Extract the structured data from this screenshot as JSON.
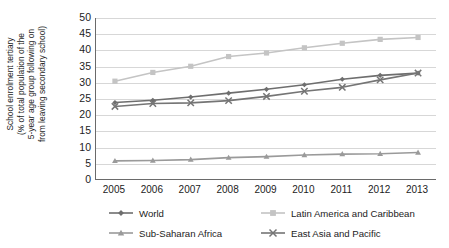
{
  "chart_data": {
    "type": "line",
    "title": "",
    "xlabel": "",
    "ylabel": "School enrolment tertiary (% of total population of the 5-year age group following on from leaving secondary school)",
    "ylabel_lines": [
      "School enrolment tertiary",
      "(% of total population of the",
      "5-year age group following on",
      "from leaving secondary school)"
    ],
    "categories": [
      "2005",
      "2006",
      "2007",
      "2008",
      "2009",
      "2010",
      "2011",
      "2012",
      "2013"
    ],
    "x": [
      2005,
      2006,
      2007,
      2008,
      2009,
      2010,
      2011,
      2012,
      2013
    ],
    "ylim": [
      0,
      50
    ],
    "yticks": [
      0,
      5,
      10,
      15,
      20,
      25,
      30,
      35,
      40,
      45,
      50
    ],
    "grid": "horizontal",
    "legend_position": "bottom",
    "series": [
      {
        "name": "World",
        "marker": "diamond",
        "color": "#6e6e6e",
        "values": [
          23.9,
          24.6,
          25.6,
          26.8,
          28.0,
          29.4,
          31.1,
          32.3,
          33.0
        ]
      },
      {
        "name": "Latin America and Caribbean",
        "marker": "square",
        "color": "#c4c4c4",
        "values": [
          30.5,
          33.2,
          35.1,
          38.1,
          39.2,
          40.8,
          42.2,
          43.4,
          44.0
        ]
      },
      {
        "name": "Sub-Saharan Africa",
        "marker": "triangle",
        "color": "#9a9a9a",
        "values": [
          5.9,
          6.0,
          6.3,
          6.9,
          7.2,
          7.7,
          8.0,
          8.1,
          8.5
        ]
      },
      {
        "name": "East Asia and Pacific",
        "marker": "cross",
        "color": "#757575",
        "values": [
          22.7,
          23.6,
          23.8,
          24.5,
          25.8,
          27.4,
          28.6,
          30.9,
          33.0
        ]
      }
    ]
  },
  "axis": {
    "line_color": "#6a6a6a",
    "grid_color": "#d7d7d7"
  }
}
